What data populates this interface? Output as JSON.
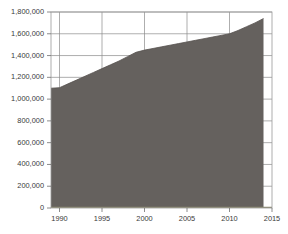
{
  "chart_data": {
    "type": "area",
    "title": "",
    "subtitle": "",
    "xlabel": "",
    "ylabel": "",
    "xlim": [
      1989,
      2015
    ],
    "ylim": [
      0,
      1800000
    ],
    "grid": true,
    "legend": null,
    "x_tick_labels": [
      "1990",
      "1995",
      "2000",
      "2005",
      "2010",
      "2015"
    ],
    "x_ticks": [
      1990,
      1995,
      2000,
      2005,
      2010,
      2015
    ],
    "y_tick_labels": [
      "0",
      "200,000",
      "400,000",
      "600,000",
      "800,000",
      "1,000,000",
      "1,200,000",
      "1,400,000",
      "1,600,000",
      "1,800,000"
    ],
    "y_ticks": [
      0,
      200000,
      400000,
      600000,
      800000,
      1000000,
      1200000,
      1400000,
      1600000,
      1800000
    ],
    "series": [
      {
        "name": "Series 1",
        "color": "#65615e",
        "x": [
          1989,
          1990,
          1991,
          1992,
          1993,
          1994,
          1995,
          1996,
          1997,
          1998,
          1999,
          2000,
          2001,
          2002,
          2003,
          2004,
          2005,
          2006,
          2007,
          2008,
          2009,
          2010,
          2011,
          2012,
          2013,
          2014
        ],
        "values": [
          1100000,
          1105000,
          1140000,
          1175000,
          1210000,
          1245000,
          1280000,
          1315000,
          1350000,
          1390000,
          1430000,
          1450000,
          1465000,
          1480000,
          1495000,
          1510000,
          1525000,
          1540000,
          1555000,
          1570000,
          1585000,
          1600000,
          1630000,
          1665000,
          1700000,
          1740000
        ]
      }
    ],
    "colors": {
      "fill": "#65615e",
      "grid": "#8b8b8b",
      "axis_text": "#3a3a3a",
      "plot_background": "#ffffff",
      "page_background": "#ffffff",
      "baseline": "#8e8c72"
    }
  }
}
